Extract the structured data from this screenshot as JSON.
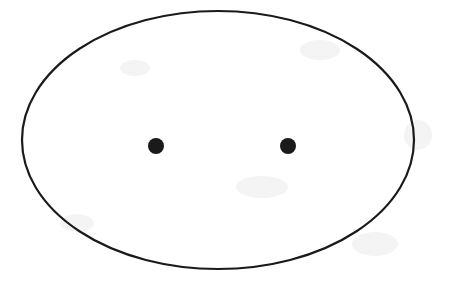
{
  "figure": {
    "background_color": "#ffffff",
    "stroke_color": "#1a1a1a",
    "fill_color": "#ffffff",
    "dot_color": "#1a1a1a",
    "canvas": {
      "width": 449,
      "height": 290
    },
    "ellipse": {
      "label": "ellipse-outline",
      "center_x": 218,
      "center_y": 140,
      "radius_x": 196,
      "radius_y": 129,
      "stroke_width": 2.2,
      "fill": "none",
      "bounds": {
        "left": 22,
        "right": 414,
        "top": 11,
        "bottom": 269
      }
    },
    "points": [
      {
        "name": "focus-left",
        "label": "Left focus",
        "cx": 156,
        "cy": 146,
        "r": 8
      },
      {
        "name": "focus-right",
        "label": "Right focus",
        "cx": 288,
        "cy": 146,
        "r": 8
      }
    ],
    "artifacts": [
      {
        "left": 352,
        "top": 232,
        "width": 46,
        "height": 24
      },
      {
        "left": 60,
        "top": 214,
        "width": 34,
        "height": 18
      },
      {
        "left": 300,
        "top": 40,
        "width": 40,
        "height": 20
      },
      {
        "left": 120,
        "top": 60,
        "width": 30,
        "height": 16
      },
      {
        "left": 236,
        "top": 176,
        "width": 52,
        "height": 22
      },
      {
        "left": 404,
        "top": 120,
        "width": 28,
        "height": 30
      }
    ]
  }
}
